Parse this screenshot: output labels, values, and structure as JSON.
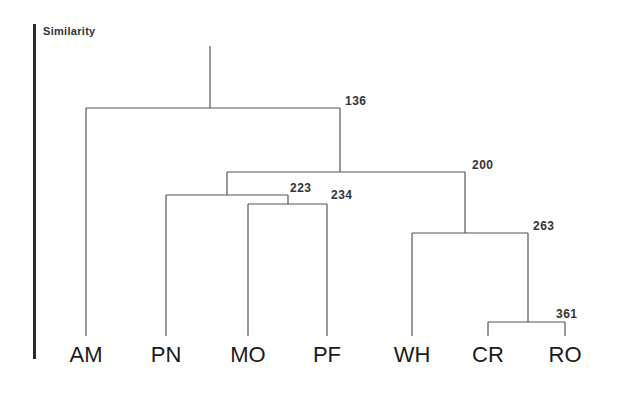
{
  "axis": {
    "title": "Similarity"
  },
  "leaves": [
    {
      "label": "AM",
      "x": 86
    },
    {
      "label": "PN",
      "x": 166
    },
    {
      "label": "MO",
      "x": 248
    },
    {
      "label": "PF",
      "x": 327
    },
    {
      "label": "WH",
      "x": 412
    },
    {
      "label": "CR",
      "x": 488
    },
    {
      "label": "RO",
      "x": 565
    }
  ],
  "nodes": [
    {
      "id": "n136",
      "value": "136",
      "left": 86,
      "right": 340,
      "y": 108,
      "label_x": 345,
      "label_y": 94
    },
    {
      "id": "n200",
      "value": "200",
      "left": 227,
      "right": 465,
      "y": 172,
      "label_x": 472,
      "label_y": 158
    },
    {
      "id": "n223",
      "value": "223",
      "left": 166,
      "right": 288,
      "y": 195,
      "label_x": 290,
      "label_y": 181
    },
    {
      "id": "n234",
      "value": "234",
      "left": 248,
      "right": 327,
      "y": 204,
      "label_x": 331,
      "label_y": 188
    },
    {
      "id": "n263",
      "value": "263",
      "left": 412,
      "right": 528,
      "y": 233,
      "label_x": 533,
      "label_y": 219
    },
    {
      "id": "n361",
      "value": "361",
      "left": 488,
      "right": 565,
      "y": 322,
      "label_x": 556,
      "label_y": 307
    }
  ],
  "root": {
    "x": 210,
    "top": 46,
    "bottom": 108
  },
  "line_color": "#555555"
}
